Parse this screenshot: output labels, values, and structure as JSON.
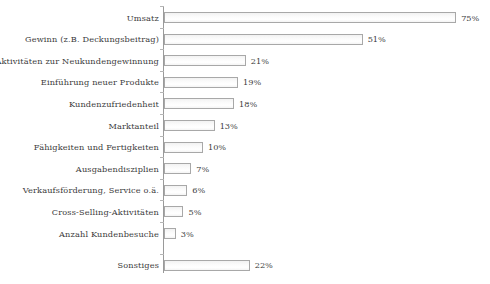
{
  "chart_data": {
    "type": "bar",
    "orientation": "horizontal",
    "title": "",
    "subtitle": "",
    "xlabel": "",
    "ylabel": "",
    "xlim": [
      0,
      80
    ],
    "grid": false,
    "legend": null,
    "value_suffix": "%",
    "categories": [
      "Umsatz",
      "Gewinn (z.B. Deckungsbeitrag)",
      "Aktivitäten zur Neukundengewinnung",
      "Einführung neuer Produkte",
      "Kundenzufriedenheit",
      "Marktanteil",
      "Fähigkeiten und Fertigkeiten",
      "Ausgabendisziplien",
      "Verkaufsförderung, Service o.ä.",
      "Cross-Selling-Aktivitäten",
      "Anzahl Kundenbesuche",
      "Sonstiges"
    ],
    "values": [
      75,
      51,
      21,
      19,
      18,
      13,
      10,
      7,
      6,
      5,
      3,
      22
    ],
    "value_labels": [
      "75%",
      "51%",
      "21%",
      "19%",
      "18%",
      "13%",
      "10%",
      "7%",
      "6%",
      "5%",
      "3%",
      "22%"
    ],
    "bars": [
      {
        "label": "Umsatz",
        "value": 75,
        "value_label": "75%"
      },
      {
        "label": "Gewinn (z.B. Deckungsbeitrag)",
        "value": 51,
        "value_label": "51%"
      },
      {
        "label": "Aktivitäten zur Neukundengewinnung",
        "value": 21,
        "value_label": "21%"
      },
      {
        "label": "Einführung neuer Produkte",
        "value": 19,
        "value_label": "19%"
      },
      {
        "label": "Kundenzufriedenheit",
        "value": 18,
        "value_label": "18%"
      },
      {
        "label": "Marktanteil",
        "value": 13,
        "value_label": "13%"
      },
      {
        "label": "Fähigkeiten und Fertigkeiten",
        "value": 10,
        "value_label": "10%"
      },
      {
        "label": "Ausgabendisziplien",
        "value": 7,
        "value_label": "7%"
      },
      {
        "label": "Verkaufsförderung, Service o.ä.",
        "value": 6,
        "value_label": "6%"
      },
      {
        "label": "Cross-Selling-Aktivitäten",
        "value": 5,
        "value_label": "5%"
      },
      {
        "label": "Anzahl Kundenbesuche",
        "value": 3,
        "value_label": "3%"
      },
      {
        "label": "Sonstiges",
        "value": 22,
        "value_label": "22%"
      }
    ],
    "colors": {
      "bar_fill": "#fafafa",
      "bar_border": "#a8a8a8",
      "axis": "#9a9a9a",
      "text": "#3b3b3b",
      "background": "#ffffff"
    }
  }
}
